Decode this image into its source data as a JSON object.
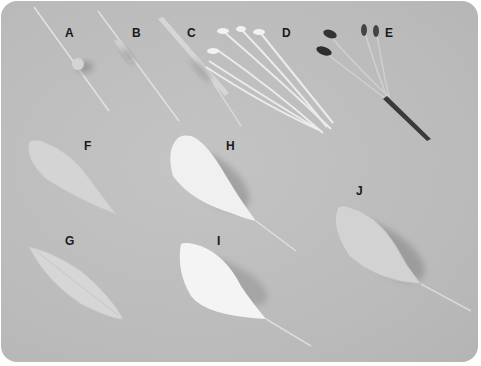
{
  "photo": {
    "background_color": "#bdbdbd",
    "labels": [
      {
        "id": "A",
        "x": 64,
        "y": 25
      },
      {
        "id": "B",
        "x": 131,
        "y": 25
      },
      {
        "id": "C",
        "x": 186,
        "y": 25
      },
      {
        "id": "D",
        "x": 281,
        "y": 25
      },
      {
        "id": "E",
        "x": 384,
        "y": 25
      },
      {
        "id": "F",
        "x": 83,
        "y": 138
      },
      {
        "id": "H",
        "x": 225,
        "y": 138
      },
      {
        "id": "G",
        "x": 64,
        "y": 233
      },
      {
        "id": "I",
        "x": 216,
        "y": 233
      },
      {
        "id": "J",
        "x": 355,
        "y": 183
      }
    ]
  }
}
